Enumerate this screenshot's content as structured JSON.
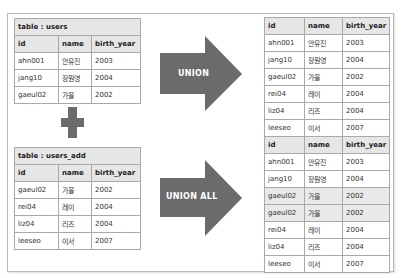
{
  "colors": {
    "arrow": "#6b6b6b",
    "header_bg": "#e6e6e6",
    "border": "#a9a9a9",
    "highlight_row": "#e9e9e9"
  },
  "columns": [
    "id",
    "name",
    "birth_year"
  ],
  "table_users": {
    "title": "table : users",
    "rows": [
      [
        "ahn001",
        "안유진",
        "2003"
      ],
      [
        "jang10",
        "장원영",
        "2004"
      ],
      [
        "gaeul02",
        "가을",
        "2002"
      ]
    ]
  },
  "operator": {
    "icon": "plus-icon"
  },
  "table_users_add": {
    "title": "table : users_add",
    "rows": [
      [
        "gaeul02",
        "가을",
        "2002"
      ],
      [
        "rei04",
        "레이",
        "2004"
      ],
      [
        "liz04",
        "리즈",
        "2004"
      ],
      [
        "leeseo",
        "이서",
        "2007"
      ]
    ]
  },
  "arrows": {
    "union": {
      "label": "UNION",
      "icon": "right-arrow-icon"
    },
    "union_all": {
      "label": "UNION ALL",
      "icon": "right-arrow-icon"
    }
  },
  "result_union": {
    "rows": [
      [
        "ahn001",
        "안유진",
        "2003"
      ],
      [
        "jang10",
        "장원영",
        "2004"
      ],
      [
        "gaeul02",
        "가을",
        "2002"
      ],
      [
        "rei04",
        "레이",
        "2004"
      ],
      [
        "liz04",
        "리즈",
        "2004"
      ],
      [
        "leeseo",
        "이서",
        "2007"
      ]
    ]
  },
  "result_union_all": {
    "rows": [
      [
        "ahn001",
        "안유진",
        "2003"
      ],
      [
        "jang10",
        "장원영",
        "2004"
      ],
      [
        "gaeul02",
        "가을",
        "2002"
      ],
      [
        "gaeul02",
        "가을",
        "2002"
      ],
      [
        "rei04",
        "레이",
        "2004"
      ],
      [
        "liz04",
        "리즈",
        "2004"
      ],
      [
        "leeseo",
        "이서",
        "2007"
      ]
    ],
    "highlighted_rows": [
      2,
      3
    ]
  }
}
